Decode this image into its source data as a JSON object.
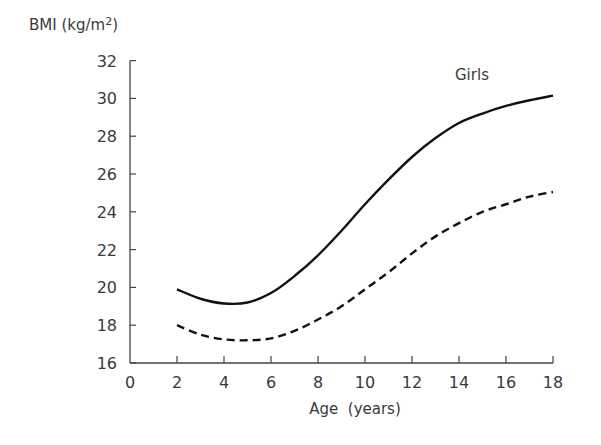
{
  "chart_data": {
    "type": "line",
    "title": "",
    "annotation": "Girls",
    "ylabel": "BMI (kg/m²)",
    "ylabel_main": "BMI (kg/m",
    "ylabel_sup": "2",
    "ylabel_close": ")",
    "xlabel": "Age  (years)",
    "xlim": [
      0,
      18
    ],
    "ylim": [
      16,
      32
    ],
    "xticks": [
      0,
      2,
      4,
      6,
      8,
      10,
      12,
      14,
      16,
      18
    ],
    "yticks": [
      16,
      18,
      20,
      22,
      24,
      26,
      28,
      30,
      32
    ],
    "grid": false,
    "legend": "none",
    "x": [
      2,
      3,
      4,
      5,
      6,
      7,
      8,
      9,
      10,
      11,
      12,
      13,
      14,
      15,
      16,
      17,
      18
    ],
    "series": [
      {
        "name": "upper (solid)",
        "style": "solid",
        "values": [
          19.9,
          19.4,
          19.15,
          19.2,
          19.7,
          20.6,
          21.7,
          23.0,
          24.4,
          25.7,
          26.9,
          27.9,
          28.7,
          29.2,
          29.6,
          29.9,
          30.15
        ]
      },
      {
        "name": "lower (dashed)",
        "style": "dashed",
        "values": [
          18.0,
          17.5,
          17.25,
          17.2,
          17.3,
          17.7,
          18.3,
          19.0,
          19.9,
          20.8,
          21.8,
          22.7,
          23.4,
          24.0,
          24.4,
          24.8,
          25.05
        ]
      }
    ]
  }
}
